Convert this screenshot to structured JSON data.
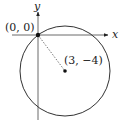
{
  "diagram": {
    "axes": {
      "x_label": "x",
      "y_label": "y"
    },
    "origin_point": {
      "label": "(0, 0)",
      "coords": [
        0,
        0
      ]
    },
    "center_point": {
      "label": "(3, −4)",
      "coords": [
        3,
        -4
      ]
    },
    "circle": {
      "center": [
        3,
        -4
      ],
      "radius": 5,
      "passes_through": [
        0,
        0
      ]
    },
    "radius_segment": {
      "style": "dotted",
      "from": [
        0,
        0
      ],
      "to": [
        3,
        -4
      ]
    }
  }
}
